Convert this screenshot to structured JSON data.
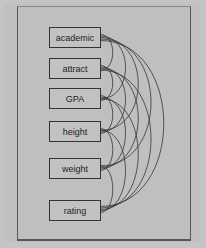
{
  "diagram": {
    "type": "covariance-path-diagram",
    "nodes": [
      {
        "label": "academic",
        "y": 27
      },
      {
        "label": "attract",
        "y": 58
      },
      {
        "label": "GPA",
        "y": 88
      },
      {
        "label": "height",
        "y": 121
      },
      {
        "label": "weight",
        "y": 158
      },
      {
        "label": "rating",
        "y": 200
      }
    ],
    "colors": {
      "background": "#c0c0c0",
      "line": "#333333"
    }
  }
}
